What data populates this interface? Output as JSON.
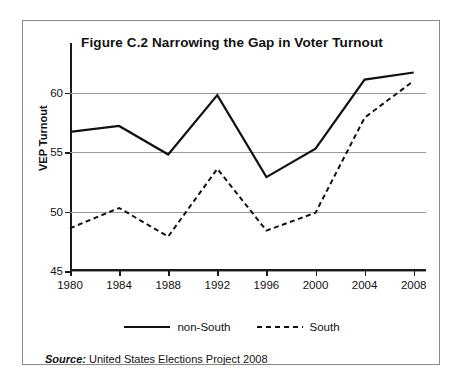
{
  "figure": {
    "title": "Figure C.2  Narrowing the Gap in Voter Turnout",
    "source_label": "Source:",
    "source_text": " United States Elections Project 2008"
  },
  "legend": {
    "items": [
      {
        "label": "non-South",
        "style": "solid"
      },
      {
        "label": "South",
        "style": "dashed"
      }
    ]
  },
  "axes": {
    "y_title": "VEP Turnout",
    "y_ticks": [
      "45",
      "50",
      "55",
      "60"
    ],
    "x_ticks": [
      "1980",
      "1984",
      "1988",
      "1992",
      "1996",
      "2000",
      "2004",
      "2008"
    ]
  },
  "chart_data": {
    "type": "line",
    "title": "Figure C.2  Narrowing the Gap in Voter Turnout",
    "xlabel": "",
    "ylabel": "VEP Turnout",
    "x": [
      1980,
      1984,
      1988,
      1992,
      1996,
      2000,
      2004,
      2008
    ],
    "xlim": [
      1980,
      2009
    ],
    "ylim": [
      45,
      62.5
    ],
    "y_ticks": [
      45,
      50,
      55,
      60
    ],
    "grid": "horizontal",
    "legend_position": "below-plot",
    "series": [
      {
        "name": "non-South",
        "style": "solid",
        "color": "#111111",
        "values": [
          56.7,
          57.2,
          54.8,
          59.8,
          52.9,
          55.3,
          61.1,
          61.7
        ]
      },
      {
        "name": "South",
        "style": "dashed",
        "color": "#111111",
        "values": [
          48.6,
          50.3,
          47.9,
          53.6,
          48.4,
          49.9,
          57.9,
          61.0
        ]
      }
    ],
    "source": "Source: United States Elections Project 2008"
  }
}
